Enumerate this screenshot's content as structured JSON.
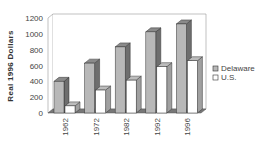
{
  "chart_data": {
    "type": "bar",
    "style": "3d-clustered-column",
    "title": "",
    "xlabel": "",
    "ylabel": "Real 1996 Dollars",
    "categories": [
      "1962",
      "1972",
      "1982",
      "1992",
      "1996"
    ],
    "series": [
      {
        "name": "Delaware",
        "values": [
          400,
          630,
          835,
          1025,
          1125
        ],
        "color": "#b8b8b8"
      },
      {
        "name": "U.S.",
        "values": [
          90,
          290,
          415,
          585,
          660
        ],
        "color": "#ffffff"
      }
    ],
    "ylim": [
      0,
      1200
    ],
    "yticks": [
      0,
      200,
      400,
      600,
      800,
      1000,
      1200
    ],
    "grid": false,
    "legend_position": "right"
  }
}
